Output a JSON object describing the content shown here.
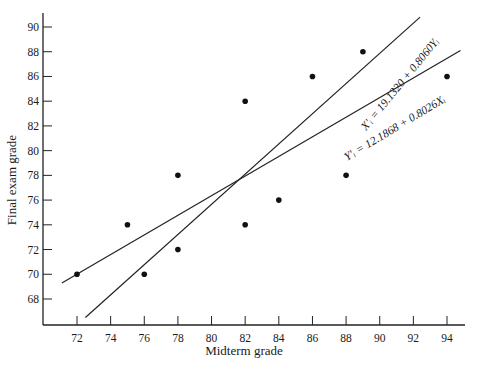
{
  "chart_data": {
    "type": "scatter",
    "title": "",
    "xlabel": "Midterm grade",
    "ylabel": "Final exam grade",
    "xlim": [
      66,
      95
    ],
    "ylim": [
      66.5,
      91
    ],
    "x_ticks": [
      72,
      74,
      76,
      78,
      80,
      82,
      84,
      86,
      88,
      90,
      92,
      94
    ],
    "y_ticks": [
      68,
      70,
      72,
      74,
      76,
      78,
      80,
      82,
      84,
      86,
      88,
      90
    ],
    "grid": false,
    "legend": null,
    "points": [
      {
        "x": 72,
        "y": 70
      },
      {
        "x": 75,
        "y": 74
      },
      {
        "x": 76,
        "y": 70
      },
      {
        "x": 78,
        "y": 78
      },
      {
        "x": 78,
        "y": 72
      },
      {
        "x": 82,
        "y": 84
      },
      {
        "x": 82,
        "y": 74
      },
      {
        "x": 84,
        "y": 76
      },
      {
        "x": 86,
        "y": 86
      },
      {
        "x": 88,
        "y": 78
      },
      {
        "x": 89,
        "y": 88
      },
      {
        "x": 94,
        "y": 86
      }
    ],
    "lines": [
      {
        "name": "regression of X on Y",
        "label": "X'ᵢ = 19.1320 + 0.8060Yᵢ",
        "intercept": 19.132,
        "slope": 0.806,
        "predicts": "X",
        "from": {
          "x": 72.5,
          "y": 66.5
        },
        "to": {
          "x": 92.4,
          "y": 90.8
        }
      },
      {
        "name": "regression of Y on X",
        "label": "Y'ᵢ = 12.1868 + 0.8026Xᵢ",
        "intercept": 12.1868,
        "slope": 0.8026,
        "predicts": "Y",
        "from": {
          "x": 71.1,
          "y": 69.3
        },
        "to": {
          "x": 94.8,
          "y": 88.1
        }
      }
    ],
    "annotations": [
      "X'ᵢ = 19.1320 + 0.8060Yᵢ",
      "Y'ᵢ = 12.1868 + 0.8026Xᵢ"
    ]
  }
}
